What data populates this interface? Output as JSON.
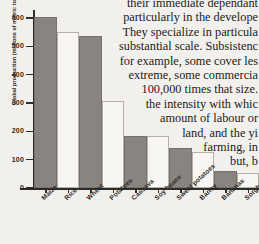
{
  "prose": {
    "lines": [
      "their immediate dependant",
      "particularly in the develope",
      "They specialize in particula",
      "substantial scale. Subsistenc",
      "for example, some cover les",
      "extreme, some commercia",
      "100,000 times that size.",
      "the intensity with whic",
      "amount of labour or",
      "land, and the yi",
      "farming, in",
      "but, b"
    ]
  },
  "chart_data": {
    "type": "bar",
    "title": "",
    "xlabel": "",
    "ylabel": "Global production (millions of metric tonnes)",
    "categories": [
      "Maize",
      "Rice",
      "Wheat",
      "Potatoes",
      "Cassava",
      "Soy beans",
      "Sweet potatoes",
      "Barley",
      "Bananas",
      "Sorghum"
    ],
    "values": [
      605,
      550,
      535,
      307,
      185,
      185,
      140,
      128,
      60,
      53
    ],
    "ylim": [
      0,
      640
    ],
    "yticks": [
      0,
      100,
      200,
      300,
      400,
      500,
      600
    ],
    "ytick_labels": [
      "0",
      "100",
      "200",
      "300",
      "400",
      "500",
      "600"
    ],
    "grid": false,
    "legend": "none",
    "bar_fills": [
      "dark",
      "light",
      "dark",
      "light",
      "dark",
      "light",
      "dark",
      "light",
      "dark",
      "light"
    ],
    "colors": {
      "bar_dark": "#888580",
      "bar_light": "#f7f6f3",
      "axis": "#2e2c29",
      "text": "#2b2926",
      "background": "#f2f0ec"
    }
  }
}
